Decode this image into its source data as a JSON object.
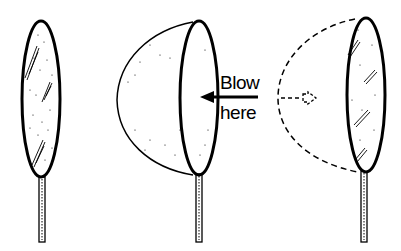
{
  "diagram": {
    "stages": [
      {
        "id": "flat",
        "name": "Flat soap film on wand"
      },
      {
        "id": "blown",
        "name": "Film bulging when blown"
      },
      {
        "id": "return",
        "name": "Film returning flat (dashed former shape)"
      }
    ],
    "labels": {
      "blow_line1": "Blow",
      "blow_line2": "here"
    },
    "colors": {
      "stroke": "#000000",
      "background": "#ffffff"
    }
  }
}
